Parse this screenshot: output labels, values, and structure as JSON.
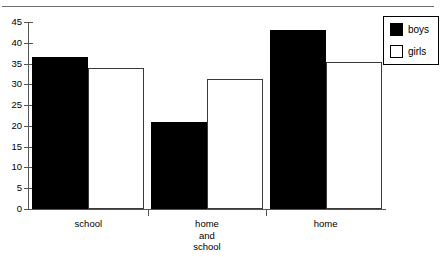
{
  "caption": {
    "cropped_text": "",
    "note": ""
  },
  "legend": {
    "position": "top-right",
    "entries": [
      {
        "label": "boys",
        "swatch": "filled-black-square",
        "color": "#000000"
      },
      {
        "label": "girls",
        "swatch": "outlined-white-square",
        "color": "#ffffff"
      }
    ]
  },
  "chart_data": {
    "type": "bar",
    "title": "",
    "xlabel": "",
    "ylabel": "",
    "categories": [
      "school",
      "home\nand\nschool",
      "home"
    ],
    "category_lines": [
      [
        "school"
      ],
      [
        "home",
        "and",
        "school"
      ],
      [
        "home"
      ]
    ],
    "series": [
      {
        "name": "boys",
        "color": "#000000",
        "values": [
          36.5,
          21,
          43
        ]
      },
      {
        "name": "girls",
        "color": "#ffffff",
        "values": [
          34,
          31.3,
          35.3
        ]
      }
    ],
    "ylim": [
      0,
      45
    ],
    "ytick_step": 5,
    "yticks": [
      0,
      5,
      10,
      15,
      20,
      25,
      30,
      35,
      40,
      45
    ],
    "ytick_labels": [
      "0",
      "5",
      "10",
      "15",
      "20",
      "25",
      "30",
      "35",
      "40",
      "45"
    ],
    "grid": false,
    "legend_position": "top-right"
  }
}
